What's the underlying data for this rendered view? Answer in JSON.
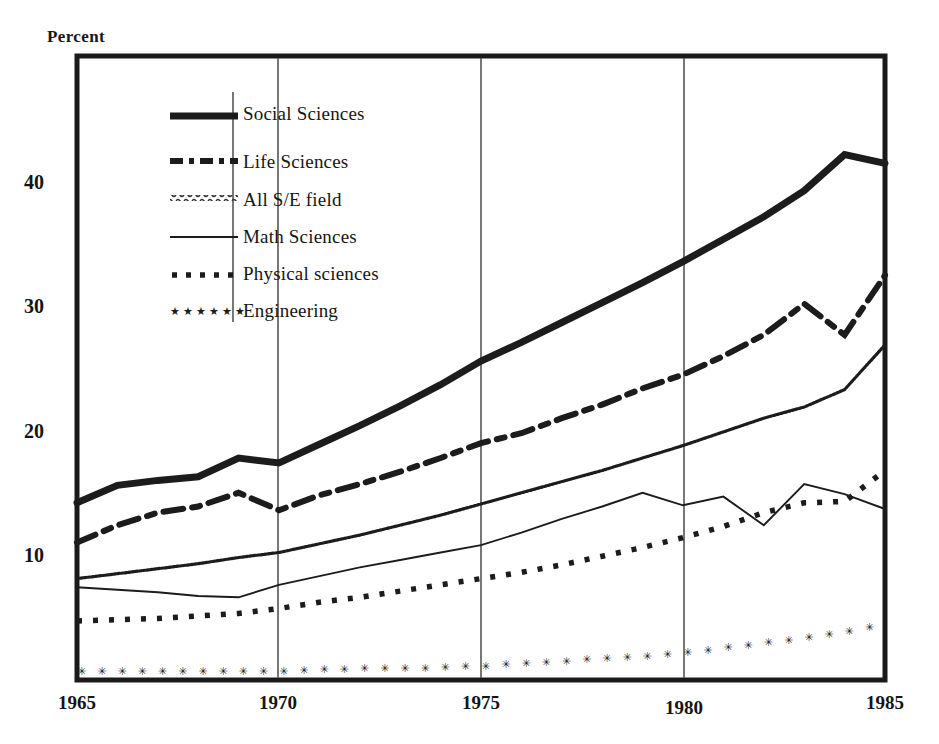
{
  "chart_data": {
    "type": "line",
    "title": "",
    "xlabel": "",
    "ylabel": "Percent",
    "xlim": [
      1965,
      1985
    ],
    "ylim": [
      0,
      46
    ],
    "xticks": [
      1965,
      1970,
      1975,
      1980,
      1985
    ],
    "yticks": [
      10,
      20,
      30,
      40
    ],
    "grid": "vertical gridlines at 1970, 1975, 1980",
    "legend_position": "upper-left inside plot",
    "x": [
      1965,
      1966,
      1967,
      1968,
      1969,
      1970,
      1971,
      1972,
      1973,
      1974,
      1975,
      1976,
      1977,
      1978,
      1979,
      1980,
      1981,
      1982,
      1983,
      1984,
      1985
    ],
    "series": [
      {
        "name": "Social Sciences",
        "style": "thick-solid",
        "values": [
          14.2,
          15.6,
          16.0,
          16.3,
          17.8,
          17.4,
          18.9,
          20.4,
          22.0,
          23.7,
          25.6,
          27.1,
          28.7,
          30.3,
          31.9,
          33.6,
          35.4,
          37.2,
          39.3,
          42.2,
          41.5
        ]
      },
      {
        "name": "Life Sciences",
        "style": "dash-dot",
        "values": [
          11.0,
          12.4,
          13.4,
          13.9,
          15.0,
          13.6,
          14.8,
          15.7,
          16.7,
          17.8,
          19.0,
          19.8,
          21.0,
          22.1,
          23.4,
          24.5,
          26.0,
          27.7,
          30.2,
          27.7,
          32.5
        ]
      },
      {
        "name": "All S/E field",
        "style": "fine-wavy",
        "values": [
          8.1,
          8.5,
          8.9,
          9.3,
          9.8,
          10.2,
          10.9,
          11.6,
          12.4,
          13.2,
          14.1,
          15.0,
          15.9,
          16.8,
          17.8,
          18.8,
          19.9,
          21.0,
          21.9,
          23.3,
          26.9
        ]
      },
      {
        "name": "Math Sciences",
        "style": "thin-solid",
        "values": [
          7.4,
          7.2,
          7.0,
          6.7,
          6.6,
          7.6,
          8.3,
          9.0,
          9.6,
          10.2,
          10.8,
          11.8,
          12.9,
          13.9,
          15.0,
          14.0,
          14.7,
          12.4,
          15.7,
          14.9,
          13.7
        ]
      },
      {
        "name": "Physical sciences",
        "style": "square-dot",
        "values": [
          4.7,
          4.8,
          4.9,
          5.1,
          5.3,
          5.7,
          6.2,
          6.6,
          7.1,
          7.6,
          8.1,
          8.6,
          9.2,
          9.9,
          10.6,
          11.4,
          12.3,
          13.4,
          14.2,
          14.3,
          16.8
        ]
      },
      {
        "name": "Engineering",
        "style": "glyph-marker",
        "values": [
          0.7,
          0.7,
          0.7,
          0.7,
          0.7,
          0.7,
          0.8,
          0.9,
          0.9,
          1.0,
          1.1,
          1.3,
          1.5,
          1.7,
          1.9,
          2.2,
          2.6,
          3.0,
          3.4,
          3.9,
          4.6
        ]
      }
    ]
  },
  "axis": {
    "y_title": "Percent",
    "yticks": [
      {
        "label": "40"
      },
      {
        "label": "30"
      },
      {
        "label": "20"
      },
      {
        "label": "10"
      }
    ],
    "xticks": [
      {
        "label": "1965"
      },
      {
        "label": "1970"
      },
      {
        "label": "1975"
      },
      {
        "label": "1980"
      },
      {
        "label": "1985"
      }
    ]
  },
  "legend": {
    "items": [
      {
        "label": "Social Sciences",
        "swatch": "thick-solid-swatch"
      },
      {
        "label": "Life Sciences",
        "swatch": "dash-dot-swatch"
      },
      {
        "label": "All S/E field",
        "swatch": "fine-wavy-swatch"
      },
      {
        "label": "Math Sciences",
        "swatch": "thin-solid-swatch"
      },
      {
        "label": "Physical sciences",
        "swatch": "square-dot-swatch"
      },
      {
        "label": "Engineering",
        "swatch": "glyph-marker-swatch"
      }
    ]
  },
  "colors": {
    "ink": "#1a1a1a",
    "grid": "#4a4a4a",
    "background": "#ffffff"
  }
}
